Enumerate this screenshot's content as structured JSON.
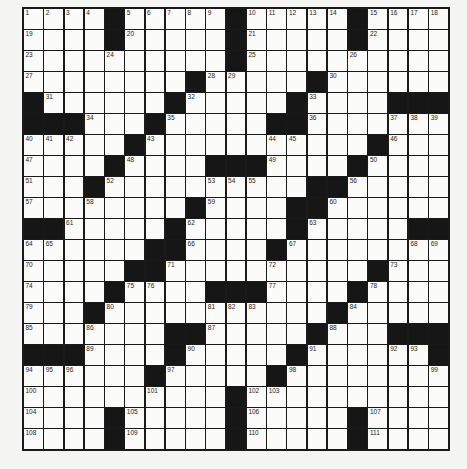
{
  "puzzle": {
    "rows": 21,
    "cols": 21,
    "colors": {
      "white": "#fbfbf9",
      "black": "#161616",
      "border": "#1a1a1a",
      "background": "#f4f4f2"
    },
    "layout": [
      "WWWWBWWWWWBWWWWWBWWWW",
      "WWWWBWWWWWBWWWWWBWWWW",
      "WWWWWWWWWWBWWWWWWWWWW",
      "WWWWWWWWBWWWWWBWWWWWW",
      "BWWWWWWBWWWWWBWWWWBBB",
      "BBBWWWBWWWWWBBWWWWWWW",
      "WWWWWBWWWWWWWWWWWBWWW",
      "WWWWBWWWWBBBWWWWBWWWW",
      "WWWBWWWWWWWWWWBBWWWWW",
      "WWWWWWWWBWWWWBBWWWWWW",
      "BBWWWWWBWWWWWBWWWWWBB",
      "WWWWWWBBWWWWBWWWWWWWW",
      "WWWWWBBWWWWWWWWWWBWWW",
      "WWWWBWWWWBBBWWWWBWWWW",
      "WWWBWWWWWWWWWWWBWWWWW",
      "WWWWWWWBBWWWWWBWWWBBB",
      "BBBWWWWBWWWWWBWWWWWWB",
      "WWWWWWBWWWWWBWWWWWWWW",
      "WWWWWWWWWWBWWWWWWWWWW",
      "WWWWBWWWWWBWWWWWBWWWW",
      "WWWWBWWWWWBWWWWWBWWWW"
    ],
    "numbers": [
      {
        "r": 1,
        "c": 1,
        "n": "1"
      },
      {
        "r": 1,
        "c": 2,
        "n": "2"
      },
      {
        "r": 1,
        "c": 3,
        "n": "3"
      },
      {
        "r": 1,
        "c": 4,
        "n": "4"
      },
      {
        "r": 1,
        "c": 6,
        "n": "5"
      },
      {
        "r": 1,
        "c": 7,
        "n": "6"
      },
      {
        "r": 1,
        "c": 8,
        "n": "7"
      },
      {
        "r": 1,
        "c": 9,
        "n": "8"
      },
      {
        "r": 1,
        "c": 10,
        "n": "9"
      },
      {
        "r": 1,
        "c": 12,
        "n": "10"
      },
      {
        "r": 1,
        "c": 13,
        "n": "11"
      },
      {
        "r": 1,
        "c": 14,
        "n": "12"
      },
      {
        "r": 1,
        "c": 15,
        "n": "13"
      },
      {
        "r": 1,
        "c": 16,
        "n": "14"
      },
      {
        "r": 1,
        "c": 18,
        "n": "15"
      },
      {
        "r": 1,
        "c": 19,
        "n": "16"
      },
      {
        "r": 1,
        "c": 20,
        "n": "17"
      },
      {
        "r": 1,
        "c": 21,
        "n": "18"
      },
      {
        "r": 2,
        "c": 1,
        "n": "19"
      },
      {
        "r": 2,
        "c": 6,
        "n": "20"
      },
      {
        "r": 2,
        "c": 12,
        "n": "21"
      },
      {
        "r": 2,
        "c": 18,
        "n": "22"
      },
      {
        "r": 3,
        "c": 1,
        "n": "23"
      },
      {
        "r": 3,
        "c": 5,
        "n": "24"
      },
      {
        "r": 3,
        "c": 12,
        "n": "25"
      },
      {
        "r": 3,
        "c": 17,
        "n": "26"
      },
      {
        "r": 4,
        "c": 1,
        "n": "27"
      },
      {
        "r": 4,
        "c": 10,
        "n": "28"
      },
      {
        "r": 4,
        "c": 11,
        "n": "29"
      },
      {
        "r": 4,
        "c": 16,
        "n": "30"
      },
      {
        "r": 5,
        "c": 2,
        "n": "31"
      },
      {
        "r": 5,
        "c": 9,
        "n": "32"
      },
      {
        "r": 5,
        "c": 15,
        "n": "33"
      },
      {
        "r": 6,
        "c": 4,
        "n": "34"
      },
      {
        "r": 6,
        "c": 8,
        "n": "35"
      },
      {
        "r": 6,
        "c": 15,
        "n": "36"
      },
      {
        "r": 6,
        "c": 19,
        "n": "37"
      },
      {
        "r": 6,
        "c": 20,
        "n": "38"
      },
      {
        "r": 6,
        "c": 21,
        "n": "39"
      },
      {
        "r": 7,
        "c": 1,
        "n": "40"
      },
      {
        "r": 7,
        "c": 2,
        "n": "41"
      },
      {
        "r": 7,
        "c": 3,
        "n": "42"
      },
      {
        "r": 7,
        "c": 7,
        "n": "43"
      },
      {
        "r": 7,
        "c": 13,
        "n": "44"
      },
      {
        "r": 7,
        "c": 14,
        "n": "45"
      },
      {
        "r": 7,
        "c": 19,
        "n": "46"
      },
      {
        "r": 8,
        "c": 1,
        "n": "47"
      },
      {
        "r": 8,
        "c": 6,
        "n": "48"
      },
      {
        "r": 8,
        "c": 13,
        "n": "49"
      },
      {
        "r": 8,
        "c": 18,
        "n": "50"
      },
      {
        "r": 9,
        "c": 1,
        "n": "51"
      },
      {
        "r": 9,
        "c": 5,
        "n": "52"
      },
      {
        "r": 9,
        "c": 10,
        "n": "53"
      },
      {
        "r": 9,
        "c": 11,
        "n": "54"
      },
      {
        "r": 9,
        "c": 12,
        "n": "55"
      },
      {
        "r": 9,
        "c": 17,
        "n": "56"
      },
      {
        "r": 10,
        "c": 1,
        "n": "57"
      },
      {
        "r": 10,
        "c": 4,
        "n": "58"
      },
      {
        "r": 10,
        "c": 10,
        "n": "59"
      },
      {
        "r": 10,
        "c": 16,
        "n": "60"
      },
      {
        "r": 11,
        "c": 3,
        "n": "61"
      },
      {
        "r": 11,
        "c": 9,
        "n": "62"
      },
      {
        "r": 11,
        "c": 15,
        "n": "63"
      },
      {
        "r": 12,
        "c": 1,
        "n": "64"
      },
      {
        "r": 12,
        "c": 2,
        "n": "65"
      },
      {
        "r": 12,
        "c": 9,
        "n": "66"
      },
      {
        "r": 12,
        "c": 14,
        "n": "67"
      },
      {
        "r": 12,
        "c": 20,
        "n": "68"
      },
      {
        "r": 12,
        "c": 21,
        "n": "69"
      },
      {
        "r": 13,
        "c": 1,
        "n": "70"
      },
      {
        "r": 13,
        "c": 8,
        "n": "71"
      },
      {
        "r": 13,
        "c": 13,
        "n": "72"
      },
      {
        "r": 13,
        "c": 19,
        "n": "73"
      },
      {
        "r": 14,
        "c": 1,
        "n": "74"
      },
      {
        "r": 14,
        "c": 6,
        "n": "75"
      },
      {
        "r": 14,
        "c": 7,
        "n": "76"
      },
      {
        "r": 14,
        "c": 13,
        "n": "77"
      },
      {
        "r": 14,
        "c": 18,
        "n": "78"
      },
      {
        "r": 15,
        "c": 1,
        "n": "79"
      },
      {
        "r": 15,
        "c": 5,
        "n": "80"
      },
      {
        "r": 15,
        "c": 10,
        "n": "81"
      },
      {
        "r": 15,
        "c": 11,
        "n": "82"
      },
      {
        "r": 15,
        "c": 12,
        "n": "83"
      },
      {
        "r": 15,
        "c": 17,
        "n": "84"
      },
      {
        "r": 16,
        "c": 1,
        "n": "85"
      },
      {
        "r": 16,
        "c": 4,
        "n": "86"
      },
      {
        "r": 16,
        "c": 10,
        "n": "87"
      },
      {
        "r": 16,
        "c": 16,
        "n": "88"
      },
      {
        "r": 17,
        "c": 4,
        "n": "89"
      },
      {
        "r": 17,
        "c": 9,
        "n": "90"
      },
      {
        "r": 17,
        "c": 15,
        "n": "91"
      },
      {
        "r": 17,
        "c": 19,
        "n": "92"
      },
      {
        "r": 17,
        "c": 20,
        "n": "93"
      },
      {
        "r": 18,
        "c": 1,
        "n": "94"
      },
      {
        "r": 18,
        "c": 2,
        "n": "95"
      },
      {
        "r": 18,
        "c": 3,
        "n": "96"
      },
      {
        "r": 18,
        "c": 8,
        "n": "97"
      },
      {
        "r": 18,
        "c": 14,
        "n": "98"
      },
      {
        "r": 18,
        "c": 21,
        "n": "99"
      },
      {
        "r": 19,
        "c": 1,
        "n": "100"
      },
      {
        "r": 19,
        "c": 7,
        "n": "101"
      },
      {
        "r": 19,
        "c": 12,
        "n": "102"
      },
      {
        "r": 19,
        "c": 13,
        "n": "103"
      },
      {
        "r": 20,
        "c": 1,
        "n": "104"
      },
      {
        "r": 20,
        "c": 6,
        "n": "105"
      },
      {
        "r": 20,
        "c": 12,
        "n": "106"
      },
      {
        "r": 20,
        "c": 18,
        "n": "107"
      },
      {
        "r": 21,
        "c": 1,
        "n": "108"
      },
      {
        "r": 21,
        "c": 6,
        "n": "109"
      },
      {
        "r": 21,
        "c": 12,
        "n": "110"
      },
      {
        "r": 21,
        "c": 18,
        "n": "111"
      }
    ]
  }
}
